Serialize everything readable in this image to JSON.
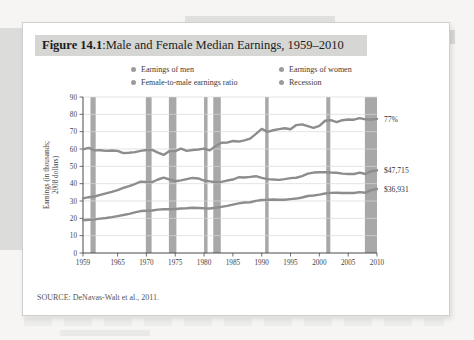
{
  "figure": {
    "number": "Figure 14.1",
    "separator": ": ",
    "title": "Male and Female Median Earnings, 1959–2010",
    "source": "SOURCE: DeNavas-Walt et al., 2011."
  },
  "legend": {
    "items": [
      {
        "label": "Earnings of men",
        "color": "#9b9b9b"
      },
      {
        "label": "Earnings of women",
        "color": "#9b9b9b"
      },
      {
        "label": "Female-to-male earnings ratio",
        "color": "#9b9b9b"
      },
      {
        "label": "Recession",
        "color": "#9b9b9b"
      }
    ]
  },
  "annotations": {
    "ratio": "77%",
    "men": "$47,715",
    "women": "$36,931"
  },
  "colors": {
    "line": "#8d8d8d",
    "recession_band": "#a8a8a8",
    "gridline": "#d8d8d8",
    "axis": "#4a4a4a",
    "title_band": "#d6d6d4",
    "card": "#ffffff"
  },
  "chart_data": {
    "type": "line",
    "title": "Male and Female Median Earnings, 1959–2010",
    "xlabel": "",
    "ylabel": "Earnings (in thousands; 2008 dollars)",
    "ylabel_lines": [
      "Earnings (in thousands;",
      "2008 dollars)"
    ],
    "xlim": [
      1959,
      2010
    ],
    "ylim": [
      0,
      90
    ],
    "yticks": [
      0,
      10,
      20,
      30,
      40,
      50,
      60,
      70,
      80,
      90
    ],
    "xticks": [
      1959,
      1965,
      1970,
      1975,
      1980,
      1985,
      1990,
      1995,
      2000,
      2005,
      2010
    ],
    "grid": "horizontal",
    "legend_position": "top",
    "series": [
      {
        "name": "Earnings of men",
        "end_label": "$47,715",
        "x": [
          1959,
          1960,
          1961,
          1962,
          1963,
          1964,
          1965,
          1966,
          1967,
          1968,
          1969,
          1970,
          1971,
          1972,
          1973,
          1974,
          1975,
          1976,
          1977,
          1978,
          1979,
          1980,
          1981,
          1982,
          1983,
          1984,
          1985,
          1986,
          1987,
          1988,
          1989,
          1990,
          1991,
          1992,
          1993,
          1994,
          1995,
          1996,
          1997,
          1998,
          1999,
          2000,
          2001,
          2002,
          2003,
          2004,
          2005,
          2006,
          2007,
          2008,
          2009,
          2010
        ],
        "values": [
          31.5,
          32.2,
          32.6,
          33.5,
          34.4,
          35.3,
          36.3,
          37.6,
          38.6,
          39.8,
          41.2,
          41.0,
          40.9,
          42.4,
          43.5,
          42.4,
          41.4,
          41.9,
          42.6,
          43.3,
          43.0,
          41.8,
          41.3,
          40.8,
          41.0,
          41.8,
          42.4,
          43.7,
          43.6,
          43.9,
          44.3,
          43.3,
          42.6,
          42.4,
          42.2,
          42.6,
          43.2,
          43.4,
          44.4,
          45.8,
          46.4,
          46.6,
          46.6,
          46.4,
          46.3,
          45.8,
          45.6,
          45.6,
          46.4,
          45.6,
          47.2,
          47.7
        ]
      },
      {
        "name": "Earnings of women",
        "end_label": "$36,931",
        "x": [
          1959,
          1960,
          1961,
          1962,
          1963,
          1964,
          1965,
          1966,
          1967,
          1968,
          1969,
          1970,
          1971,
          1972,
          1973,
          1974,
          1975,
          1976,
          1977,
          1978,
          1979,
          1980,
          1981,
          1982,
          1983,
          1984,
          1985,
          1986,
          1987,
          1988,
          1989,
          1990,
          1991,
          1992,
          1993,
          1994,
          1995,
          1996,
          1997,
          1998,
          1999,
          2000,
          2001,
          2002,
          2003,
          2004,
          2005,
          2006,
          2007,
          2008,
          2009,
          2010
        ],
        "values": [
          18.9,
          19.2,
          19.4,
          19.8,
          20.2,
          20.7,
          21.3,
          21.9,
          22.6,
          23.4,
          24.2,
          24.4,
          24.5,
          25.0,
          25.2,
          25.2,
          25.4,
          25.7,
          25.8,
          26.1,
          26.0,
          25.8,
          25.7,
          26.1,
          26.6,
          27.2,
          27.9,
          28.6,
          29.1,
          29.3,
          30.1,
          30.6,
          30.7,
          30.9,
          30.7,
          30.7,
          31.1,
          31.4,
          32.0,
          32.9,
          33.2,
          33.7,
          34.3,
          34.7,
          34.8,
          34.6,
          34.6,
          34.6,
          35.1,
          34.8,
          36.3,
          36.9
        ]
      },
      {
        "name": "Female-to-male earnings ratio",
        "end_label": "77%",
        "unit": "percent",
        "x": [
          1959,
          1960,
          1961,
          1962,
          1963,
          1964,
          1965,
          1966,
          1967,
          1968,
          1969,
          1970,
          1971,
          1972,
          1973,
          1974,
          1975,
          1976,
          1977,
          1978,
          1979,
          1980,
          1981,
          1982,
          1983,
          1984,
          1985,
          1986,
          1987,
          1988,
          1989,
          1990,
          1991,
          1992,
          1993,
          1994,
          1995,
          1996,
          1997,
          1998,
          1999,
          2000,
          2001,
          2002,
          2003,
          2004,
          2005,
          2006,
          2007,
          2008,
          2009,
          2010
        ],
        "values": [
          59.8,
          60.7,
          59.2,
          59.3,
          58.9,
          59.1,
          58.9,
          57.6,
          57.8,
          58.2,
          58.9,
          59.4,
          59.5,
          57.9,
          56.6,
          58.8,
          58.8,
          60.2,
          58.9,
          59.4,
          59.7,
          60.2,
          59.2,
          61.7,
          63.6,
          63.7,
          64.6,
          64.3,
          65.0,
          66.0,
          68.7,
          71.6,
          69.9,
          70.8,
          71.5,
          72.0,
          71.4,
          73.8,
          74.2,
          73.2,
          72.2,
          73.3,
          76.3,
          76.6,
          75.5,
          76.6,
          77.0,
          76.9,
          77.8,
          77.1,
          77.0,
          77.4
        ]
      }
    ],
    "recessions": [
      {
        "start": 1960.3,
        "end": 1961.2
      },
      {
        "start": 1969.9,
        "end": 1970.9
      },
      {
        "start": 1973.9,
        "end": 1975.2
      },
      {
        "start": 1980.0,
        "end": 1980.6
      },
      {
        "start": 1981.6,
        "end": 1982.9
      },
      {
        "start": 1990.6,
        "end": 1991.2
      },
      {
        "start": 2001.2,
        "end": 2001.9
      },
      {
        "start": 2007.9,
        "end": 2010.0
      }
    ]
  }
}
